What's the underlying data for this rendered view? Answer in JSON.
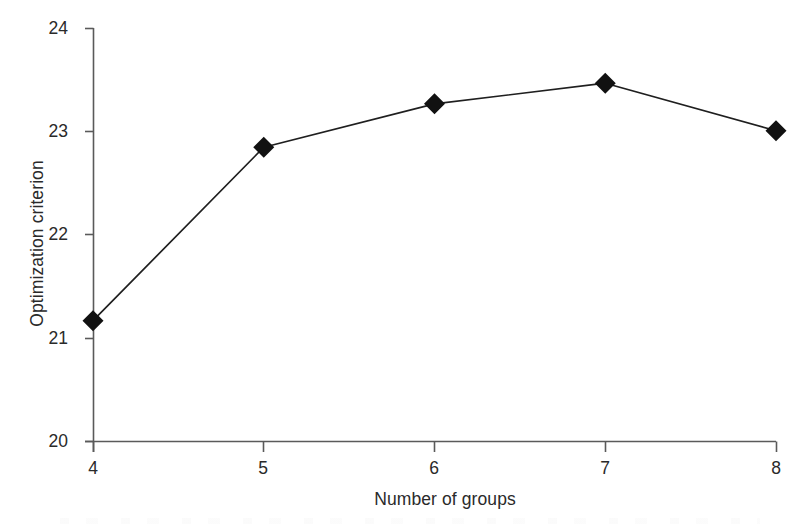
{
  "chart_data": {
    "type": "line",
    "title": "",
    "xlabel": "Number of groups",
    "ylabel": "Optimization criterion",
    "x": [
      4,
      5,
      6,
      7,
      8
    ],
    "values": [
      21.17,
      22.85,
      23.27,
      23.47,
      23.01
    ],
    "series": [
      {
        "name": "Optimization criterion",
        "x": [
          4,
          5,
          6,
          7,
          8
        ],
        "values": [
          21.17,
          22.85,
          23.27,
          23.47,
          23.01
        ],
        "marker": "filled-diamond",
        "color": "#1a1a1a"
      }
    ],
    "xlim": [
      4,
      8
    ],
    "ylim": [
      20,
      24
    ],
    "xticks": [
      4,
      5,
      6,
      7,
      8
    ],
    "yticks": [
      20,
      21,
      22,
      23,
      24
    ],
    "xtick_labels": [
      "4",
      "5",
      "6",
      "7",
      "8"
    ],
    "ytick_labels": [
      "20",
      "21",
      "22",
      "23",
      "24"
    ],
    "grid": false,
    "legend": null,
    "annotations": []
  },
  "style": {
    "ink_color": "#1a1a1a",
    "axis_color": "#555555",
    "background_color": "#ffffff",
    "marker_color": "#111111"
  }
}
